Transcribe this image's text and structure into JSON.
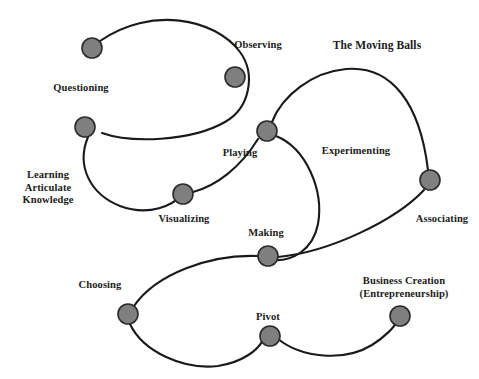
{
  "figure": {
    "title": "The Moving Balls",
    "title_pos": {
      "x": 377,
      "y": 45
    },
    "background": "#ffffff",
    "ball_fill": "#807f7f",
    "ball_stroke": "#2b2b2b",
    "curve_stroke": "#1a1a1a"
  },
  "nodes": [
    {
      "id": "questioning",
      "label": "Questioning",
      "cx": 92,
      "cy": 48,
      "r": 10,
      "label_x": 81,
      "label_y": 88
    },
    {
      "id": "observing",
      "label": "Observing",
      "cx": 235,
      "cy": 77,
      "r": 10,
      "label_x": 258,
      "label_y": 45
    },
    {
      "id": "learning",
      "label": "Learning\nArticulate\nKnowledge",
      "cx": 85,
      "cy": 127,
      "r": 10,
      "label_x": 48,
      "label_y": 188
    },
    {
      "id": "playing",
      "label": "Playing",
      "cx": 267,
      "cy": 131,
      "r": 10,
      "label_x": 240,
      "label_y": 153
    },
    {
      "id": "visualizing",
      "label": "Visualizing",
      "cx": 183,
      "cy": 194,
      "r": 10,
      "label_x": 184,
      "label_y": 219
    },
    {
      "id": "experimenting",
      "label": "Experimenting",
      "cx": null,
      "cy": null,
      "r": 0,
      "label_x": 356,
      "label_y": 151
    },
    {
      "id": "associating",
      "label": "Associating",
      "cx": 430,
      "cy": 180,
      "r": 10,
      "label_x": 442,
      "label_y": 219
    },
    {
      "id": "making",
      "label": "Making",
      "cx": 268,
      "cy": 256,
      "r": 10,
      "label_x": 266,
      "label_y": 233
    },
    {
      "id": "choosing",
      "label": "Choosing",
      "cx": 128,
      "cy": 314,
      "r": 10,
      "label_x": 100,
      "label_y": 285
    },
    {
      "id": "pivot",
      "label": "Pivot",
      "cx": 270,
      "cy": 336,
      "r": 10,
      "label_x": 268,
      "label_y": 317
    },
    {
      "id": "business",
      "label": "Business Creation\n(Entrepreneurship)",
      "cx": 400,
      "cy": 316,
      "r": 10,
      "label_x": 404,
      "label_y": 287
    }
  ],
  "curves": [
    {
      "id": "loop-questioning-observing",
      "d": "M 100 41 C 150 6 215 18 240 52 C 256 74 250 108 225 122 C 190 142 130 143 102 133"
    },
    {
      "id": "loop-learning-visualizing",
      "d": "M 88 137 C 76 166 90 194 120 206 C 150 217 173 205 183 194"
    },
    {
      "id": "arc-visualizing-playing",
      "d": "M 193 192 C 216 186 240 168 258 139"
    },
    {
      "id": "arc-playing-experimenting",
      "d": "M 272 122 C 282 96 312 72 346 69 C 392 65 420 104 428 170"
    },
    {
      "id": "arc-playing-making",
      "d": "M 276 136 C 306 148 324 190 318 224 C 313 250 292 262 272 260"
    },
    {
      "id": "arc-making-associating",
      "d": "M 278 257 C 330 252 396 220 424 190"
    },
    {
      "id": "loop-choosing-making",
      "d": "M 134 306 C 156 274 210 254 258 256"
    },
    {
      "id": "loop-choosing-pivot",
      "d": "M 130 324 C 143 352 184 370 218 366 C 243 362 258 350 263 340"
    },
    {
      "id": "arc-pivot-business",
      "d": "M 278 339 C 302 358 344 362 372 345 C 386 336 394 327 396 323"
    }
  ]
}
